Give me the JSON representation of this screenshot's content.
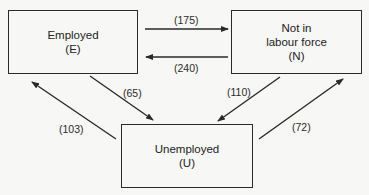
{
  "diagram": {
    "type": "labour-market-flows",
    "nodes": [
      {
        "id": "E",
        "lines": [
          "Employed",
          "(E)"
        ]
      },
      {
        "id": "N",
        "lines": [
          "Not in",
          "labour force",
          "(N)"
        ]
      },
      {
        "id": "U",
        "lines": [
          "Unemployed",
          "(U)"
        ]
      }
    ],
    "flows": [
      {
        "from": "E",
        "to": "N",
        "label": "(175)",
        "value": 175
      },
      {
        "from": "N",
        "to": "E",
        "label": "(240)",
        "value": 240
      },
      {
        "from": "E",
        "to": "U",
        "label": "(65)",
        "value": 65
      },
      {
        "from": "U",
        "to": "E",
        "label": "(103)",
        "value": 103
      },
      {
        "from": "N",
        "to": "U",
        "label": "(110)",
        "value": 110
      },
      {
        "from": "U",
        "to": "N",
        "label": "(72)",
        "value": 72
      }
    ],
    "colors": {
      "line": "#2a2a2a",
      "background": "#f7f7f5"
    }
  }
}
